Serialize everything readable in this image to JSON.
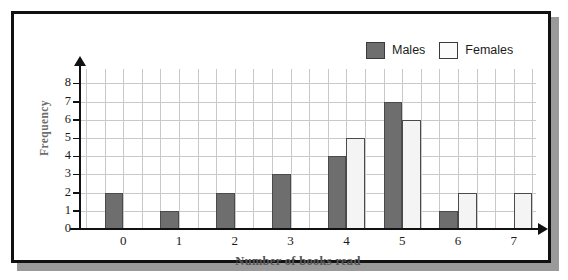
{
  "legend": {
    "items": [
      {
        "label": "Males",
        "key": "males",
        "color": "#6e6e6e"
      },
      {
        "label": "Females",
        "key": "females",
        "color": "#f4f4f4"
      }
    ]
  },
  "axes": {
    "y_title": "Frequency",
    "x_title": "Number of books read",
    "y_ticks": [
      "0",
      "1",
      "2",
      "3",
      "4",
      "5",
      "6",
      "7",
      "8"
    ],
    "x_ticks": [
      "0",
      "1",
      "2",
      "3",
      "4",
      "5",
      "6",
      "7"
    ]
  },
  "chart_data": {
    "type": "bar",
    "title": "",
    "xlabel": "Number of books read",
    "ylabel": "Frequency",
    "categories": [
      "0",
      "1",
      "2",
      "3",
      "4",
      "5",
      "6",
      "7"
    ],
    "series": [
      {
        "name": "Males",
        "color": "#6e6e6e",
        "values": [
          2,
          1,
          2,
          3,
          4,
          7,
          1,
          0
        ]
      },
      {
        "name": "Females",
        "color": "#f4f4f4",
        "values": [
          0,
          0,
          0,
          0,
          5,
          6,
          2,
          2
        ]
      }
    ],
    "ylim": [
      0,
      8.6
    ],
    "xlim": [
      -1,
      24
    ],
    "grid": true,
    "legend_position": "top-right",
    "bar_alignment": "males left of tick, females right of tick, one grid column wide"
  }
}
